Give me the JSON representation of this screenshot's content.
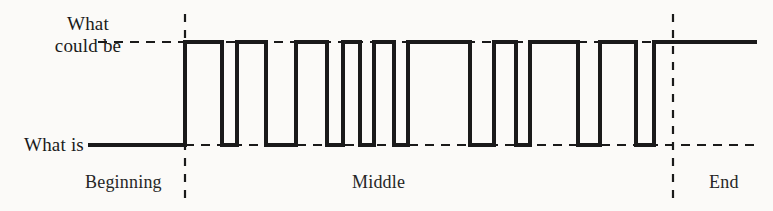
{
  "figure": {
    "kind": "square-wave-diagram",
    "background_color": "#fbfaf8",
    "ink_color": "#1a1a1a"
  },
  "labels": {
    "could_be": "What\ncould be",
    "could_be_line1": "What",
    "could_be_line2": "could be",
    "what_is": "What is",
    "beginning": "Beginning",
    "middle": "Middle",
    "end": "End"
  },
  "chart_data": {
    "type": "line",
    "title": "",
    "xlabel": "",
    "ylabel": "",
    "subtype": "square-wave",
    "y_levels": {
      "high_label": "What could be",
      "low_label": "What is",
      "high_y_px": 42,
      "low_y_px": 145
    },
    "x_range_px": [
      88,
      757
    ],
    "phase_dividers_px": [
      185,
      673
    ],
    "phases": [
      {
        "name": "Beginning",
        "start_px": 88,
        "end_px": 185,
        "label_x_px": 85
      },
      {
        "name": "Middle",
        "start_px": 185,
        "end_px": 673,
        "label_x_px": 352
      },
      {
        "name": "End",
        "start_px": 673,
        "end_px": 757,
        "label_x_px": 709
      }
    ],
    "guide_lines": [
      {
        "level": "high",
        "style": "dashed",
        "from_px": 98,
        "to_px": 757
      },
      {
        "level": "low",
        "style": "dashed",
        "from_px": 185,
        "to_px": 757
      }
    ],
    "segments": [
      {
        "level": "low",
        "start_px": 88,
        "end_px": 185
      },
      {
        "level": "high",
        "start_px": 185,
        "end_px": 222
      },
      {
        "level": "low",
        "start_px": 222,
        "end_px": 237
      },
      {
        "level": "high",
        "start_px": 237,
        "end_px": 266
      },
      {
        "level": "low",
        "start_px": 266,
        "end_px": 296
      },
      {
        "level": "high",
        "start_px": 296,
        "end_px": 327
      },
      {
        "level": "low",
        "start_px": 327,
        "end_px": 343
      },
      {
        "level": "high",
        "start_px": 343,
        "end_px": 360
      },
      {
        "level": "low",
        "start_px": 360,
        "end_px": 374
      },
      {
        "level": "high",
        "start_px": 374,
        "end_px": 394
      },
      {
        "level": "low",
        "start_px": 394,
        "end_px": 408
      },
      {
        "level": "high",
        "start_px": 408,
        "end_px": 470
      },
      {
        "level": "low",
        "start_px": 470,
        "end_px": 494
      },
      {
        "level": "high",
        "start_px": 494,
        "end_px": 516
      },
      {
        "level": "low",
        "start_px": 516,
        "end_px": 530
      },
      {
        "level": "high",
        "start_px": 530,
        "end_px": 578
      },
      {
        "level": "low",
        "start_px": 578,
        "end_px": 600
      },
      {
        "level": "high",
        "start_px": 600,
        "end_px": 636
      },
      {
        "level": "low",
        "start_px": 636,
        "end_px": 654
      },
      {
        "level": "high",
        "start_px": 654,
        "end_px": 757
      }
    ]
  }
}
